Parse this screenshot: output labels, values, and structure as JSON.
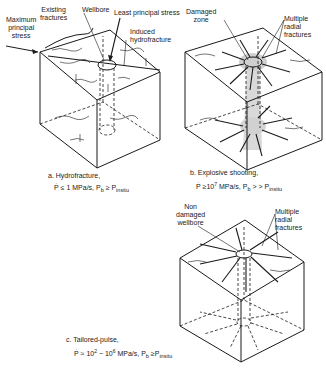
{
  "panels": [
    {
      "id": "a",
      "labels": {
        "existing_fractures": "Existing\nfractures",
        "wellbore": "Wellbore",
        "least_principal_stress": "Least principal stress",
        "maximum_principal_stress": "Maximum\nprincipal\nstress",
        "induced_hydrofracture": "Induced\nhydrofracture"
      },
      "caption_title": "a. Hydrofracture,",
      "caption_formula": {
        "rate": "Ṗ ≤ 1 MPa/s, P",
        "sub1": "b",
        "rel": " ≥ P",
        "sub2": "insitu"
      }
    },
    {
      "id": "b",
      "labels": {
        "damaged_zone": "Damaged\nzone",
        "multiple_radial_fractures": "Multiple\nradial\nfractures"
      },
      "caption_title": "b. Explosive shooting,",
      "caption_formula": {
        "rate": "Ṗ ≥10",
        "exp": "7",
        "rate2": " MPa/s, P",
        "sub1": "b",
        "rel": " > > P",
        "sub2": "insitu"
      }
    },
    {
      "id": "c",
      "labels": {
        "non_damaged_wellbore": "Non\ndamaged\nwellbore",
        "multiple_radial_fractures": "Multiple\nradial\nfractures"
      },
      "caption_title": "c. Tailored-pulse,",
      "caption_formula": {
        "rate": "Ṗ ≈ 10",
        "exp1": "2",
        "mid": " − 10",
        "exp2": "6",
        "rate2": " MPa/s, P",
        "sub1": "b",
        "rel": " ≥P",
        "sub2": "insitu"
      }
    }
  ],
  "colors": {
    "ink": "#1a1a1a",
    "damaged_zone_shade": "#c8c8c8"
  }
}
